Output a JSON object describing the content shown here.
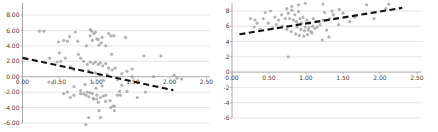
{
  "page": {
    "background": "#ffffff"
  },
  "colors": {
    "gridline": "#dcdcdc",
    "axis": "#9f9f9f",
    "marker": "#a6a6a6",
    "trendline": "#141414",
    "tick_text": "#404040"
  },
  "chart_data": [
    {
      "id": "left-scatter",
      "type": "scatter",
      "title": "",
      "xlabel": "",
      "ylabel": "",
      "legend": "none",
      "grid": "horizontal",
      "xlim": [
        0,
        2.5
      ],
      "ylim": [
        -6,
        8
      ],
      "x_tick_labels": [
        "0.00",
        "0.50",
        "1.00",
        "1.50",
        "2.00",
        "2.50"
      ],
      "x_tick_values": [
        0,
        0.5,
        1.0,
        1.5,
        2.0,
        2.5
      ],
      "y_tick_labels": [
        "8.00",
        "6.00",
        "4.00",
        "2.00",
        "0.00",
        "-2.00",
        "-4.00",
        "-6.00"
      ],
      "y_tick_values": [
        8,
        6,
        4,
        2,
        0,
        -2,
        -4,
        -6
      ],
      "marker": {
        "shape": "circle",
        "color": "#a6a6a6"
      },
      "trendline": {
        "style": "dashed",
        "color": "#141414",
        "direction": "negative",
        "x1": 0.0,
        "y1": 2.45,
        "x2": 2.05,
        "y2": -1.75
      },
      "points": [
        [
          0.23,
          5.9
        ],
        [
          0.29,
          5.9
        ],
        [
          0.49,
          4.5
        ],
        [
          0.56,
          4.7
        ],
        [
          0.61,
          4.6
        ],
        [
          0.64,
          5.2
        ],
        [
          0.72,
          5.8
        ],
        [
          0.75,
          4.6
        ],
        [
          0.87,
          4.0
        ],
        [
          0.92,
          6.1
        ],
        [
          0.94,
          5.9
        ],
        [
          0.97,
          5.6
        ],
        [
          0.99,
          5.8
        ],
        [
          1.03,
          4.8
        ],
        [
          1.04,
          4.1
        ],
        [
          1.07,
          4.4
        ],
        [
          1.08,
          5.1
        ],
        [
          1.13,
          4.0
        ],
        [
          1.17,
          5.6
        ],
        [
          1.2,
          5.3
        ],
        [
          1.24,
          5.3
        ],
        [
          1.4,
          5.1
        ],
        [
          0.92,
          5.3
        ],
        [
          0.95,
          4.7
        ],
        [
          1.01,
          4.9
        ],
        [
          0.37,
          2.4
        ],
        [
          0.47,
          1.9
        ],
        [
          0.5,
          3.1
        ],
        [
          0.52,
          2.0
        ],
        [
          0.58,
          2.4
        ],
        [
          0.65,
          1.3
        ],
        [
          0.7,
          0.9
        ],
        [
          0.76,
          2.9
        ],
        [
          0.79,
          2.4
        ],
        [
          0.83,
          2.0
        ],
        [
          0.88,
          1.6
        ],
        [
          0.92,
          1.9
        ],
        [
          0.96,
          1.7
        ],
        [
          0.99,
          1.9
        ],
        [
          1.03,
          1.6
        ],
        [
          1.06,
          1.8
        ],
        [
          1.09,
          1.4
        ],
        [
          1.13,
          1.7
        ],
        [
          1.17,
          1.1
        ],
        [
          1.21,
          2.9
        ],
        [
          1.22,
          0.9
        ],
        [
          1.26,
          1.1
        ],
        [
          1.35,
          0.4
        ],
        [
          1.42,
          0.7
        ],
        [
          1.49,
          1.0
        ],
        [
          1.65,
          2.7
        ],
        [
          1.88,
          2.7
        ],
        [
          0.36,
          -0.7
        ],
        [
          0.41,
          -0.8
        ],
        [
          0.7,
          -1.3
        ],
        [
          0.9,
          0.8
        ],
        [
          0.95,
          -0.8
        ],
        [
          0.99,
          0.5
        ],
        [
          1.05,
          0.2
        ],
        [
          1.1,
          -0.5
        ],
        [
          1.15,
          0.3
        ],
        [
          1.29,
          -0.4
        ],
        [
          1.49,
          0.0
        ],
        [
          1.78,
          0.0
        ],
        [
          2.06,
          0.2
        ],
        [
          2.16,
          -0.3
        ],
        [
          2.1,
          -0.2
        ],
        [
          0.56,
          -2.2
        ],
        [
          0.61,
          -2.0
        ],
        [
          0.65,
          -2.7
        ],
        [
          0.7,
          -2.4
        ],
        [
          0.79,
          -2.2
        ],
        [
          0.79,
          -1.8
        ],
        [
          0.83,
          -2.2
        ],
        [
          0.86,
          -2.4
        ],
        [
          0.88,
          -2.0
        ],
        [
          0.9,
          -2.6
        ],
        [
          0.92,
          -2.1
        ],
        [
          0.95,
          -2.2
        ],
        [
          0.96,
          -2.8
        ],
        [
          0.97,
          -2.9
        ],
        [
          1.01,
          -2.9
        ],
        [
          1.01,
          -2.4
        ],
        [
          1.03,
          -3.3
        ],
        [
          1.06,
          -2.7
        ],
        [
          1.1,
          -2.5
        ],
        [
          1.13,
          -3.2
        ],
        [
          1.13,
          -2.4
        ],
        [
          1.19,
          -3.1
        ],
        [
          1.29,
          -2.4
        ],
        [
          1.33,
          -2.4
        ],
        [
          1.35,
          -1.1
        ],
        [
          1.32,
          -1.9
        ],
        [
          1.42,
          -1.9
        ],
        [
          1.56,
          -2.7
        ],
        [
          1.67,
          -2.0
        ],
        [
          0.85,
          -1.0
        ],
        [
          1.0,
          -1.5
        ],
        [
          1.08,
          -1.2
        ],
        [
          0.86,
          -6.2
        ],
        [
          0.9,
          -5.3
        ],
        [
          1.06,
          -5.3
        ],
        [
          1.04,
          -4.4
        ],
        [
          1.2,
          -4.0
        ],
        [
          1.23,
          -3.8
        ],
        [
          1.25,
          -4.4
        ],
        [
          1.25,
          -3.8
        ]
      ]
    },
    {
      "id": "right-scatter",
      "type": "scatter",
      "title": "",
      "xlabel": "",
      "ylabel": "",
      "legend": "none",
      "grid": "horizontal",
      "xlim": [
        0,
        2.5
      ],
      "ylim": [
        -6,
        8
      ],
      "x_tick_labels": [
        "0.00",
        "0.50",
        "1.00",
        "1.50",
        "2.00",
        "2.50"
      ],
      "x_tick_values": [
        0,
        0.5,
        1.0,
        1.5,
        2.0,
        2.5
      ],
      "y_tick_labels": [
        "8",
        "6",
        "4",
        "2",
        "0",
        "-2",
        "-4",
        "-6"
      ],
      "y_tick_values": [
        8,
        6,
        4,
        2,
        0,
        -2,
        -4,
        -6
      ],
      "marker": {
        "shape": "circle",
        "color": "#a6a6a6"
      },
      "trendline": {
        "style": "dashed",
        "color": "#141414",
        "direction": "positive",
        "x1": 0.1,
        "y1": 4.95,
        "x2": 2.3,
        "y2": 8.4
      },
      "points": [
        [
          0.25,
          7.0
        ],
        [
          0.3,
          5.9
        ],
        [
          0.31,
          6.8
        ],
        [
          0.34,
          6.4
        ],
        [
          0.38,
          5.6
        ],
        [
          0.42,
          7.0
        ],
        [
          0.45,
          7.8
        ],
        [
          0.49,
          6.4
        ],
        [
          0.52,
          8.0
        ],
        [
          0.55,
          5.8
        ],
        [
          0.58,
          7.2
        ],
        [
          0.6,
          6.2
        ],
        [
          0.63,
          6.8
        ],
        [
          0.67,
          7.5
        ],
        [
          0.68,
          6.0
        ],
        [
          0.72,
          7.0
        ],
        [
          0.74,
          5.6
        ],
        [
          0.74,
          8.3
        ],
        [
          0.76,
          7.7
        ],
        [
          0.78,
          7.0
        ],
        [
          0.8,
          5.3
        ],
        [
          0.81,
          8.1
        ],
        [
          0.81,
          8.6
        ],
        [
          0.83,
          6.8
        ],
        [
          0.85,
          7.5
        ],
        [
          0.86,
          5.0
        ],
        [
          0.87,
          6.6
        ],
        [
          0.88,
          5.9
        ],
        [
          0.9,
          7.9
        ],
        [
          0.9,
          8.8
        ],
        [
          0.91,
          4.8
        ],
        [
          0.92,
          7.0
        ],
        [
          0.93,
          5.6
        ],
        [
          0.94,
          6.4
        ],
        [
          0.96,
          7.2
        ],
        [
          0.97,
          4.7
        ],
        [
          0.98,
          5.4
        ],
        [
          0.99,
          5.9
        ],
        [
          0.99,
          9.0
        ],
        [
          1.01,
          6.8
        ],
        [
          1.02,
          4.9
        ],
        [
          1.03,
          5.5
        ],
        [
          1.04,
          5.8
        ],
        [
          1.05,
          6.4
        ],
        [
          1.07,
          5.3
        ],
        [
          1.08,
          5.1
        ],
        [
          1.09,
          6.0
        ],
        [
          1.1,
          7.0
        ],
        [
          1.12,
          5.7
        ],
        [
          1.14,
          6.6
        ],
        [
          1.15,
          5.9
        ],
        [
          1.19,
          6.2
        ],
        [
          1.22,
          4.2
        ],
        [
          1.23,
          6.8
        ],
        [
          1.23,
          8.9
        ],
        [
          1.25,
          7.8
        ],
        [
          1.28,
          5.5
        ],
        [
          1.31,
          4.6
        ],
        [
          1.32,
          7.0
        ],
        [
          1.35,
          8.0
        ],
        [
          1.37,
          7.5
        ],
        [
          1.44,
          6.2
        ],
        [
          1.45,
          8.2
        ],
        [
          1.5,
          7.7
        ],
        [
          1.59,
          6.6
        ],
        [
          1.66,
          7.2
        ],
        [
          1.82,
          8.8
        ],
        [
          1.92,
          7.0
        ],
        [
          2.08,
          8.3
        ],
        [
          2.12,
          8.9
        ],
        [
          0.76,
          2.0
        ]
      ]
    }
  ]
}
